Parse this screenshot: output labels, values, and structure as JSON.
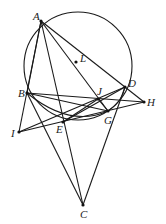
{
  "diagram": {
    "type": "geometry-figure",
    "circle": {
      "cx": 78,
      "cy": 66,
      "r": 54
    },
    "points": {
      "A": {
        "x": 41,
        "y": 21,
        "label": "A",
        "lx": 33,
        "ly": 20
      },
      "L": {
        "x": 76,
        "y": 62,
        "label": "L",
        "lx": 80,
        "ly": 62
      },
      "B": {
        "x": 27,
        "y": 93,
        "label": "B",
        "lx": 18,
        "ly": 97
      },
      "D": {
        "x": 125,
        "y": 87,
        "label": "D",
        "lx": 128,
        "ly": 87
      },
      "J": {
        "x": 98,
        "y": 99,
        "label": "J",
        "lx": 97,
        "ly": 95
      },
      "H": {
        "x": 144,
        "y": 102,
        "label": "H",
        "lx": 147,
        "ly": 106
      },
      "G": {
        "x": 108,
        "y": 111,
        "label": "G",
        "lx": 104,
        "ly": 124
      },
      "E": {
        "x": 63,
        "y": 122,
        "label": "E",
        "lx": 56,
        "ly": 133
      },
      "I": {
        "x": 19,
        "y": 132,
        "label": "I",
        "lx": 11,
        "ly": 137
      },
      "C": {
        "x": 83,
        "y": 205,
        "label": "C",
        "lx": 80,
        "ly": 218
      }
    },
    "segments": [
      [
        "A",
        "B"
      ],
      [
        "A",
        "I"
      ],
      [
        "A",
        "C"
      ],
      [
        "A",
        "G"
      ],
      [
        "A",
        "H"
      ],
      [
        "B",
        "H"
      ],
      [
        "B",
        "G"
      ],
      [
        "B",
        "C"
      ],
      [
        "I",
        "D"
      ],
      [
        "I",
        "H"
      ],
      [
        "D",
        "C"
      ],
      [
        "D",
        "E"
      ],
      [
        "E",
        "J"
      ],
      [
        "J",
        "G"
      ]
    ]
  }
}
